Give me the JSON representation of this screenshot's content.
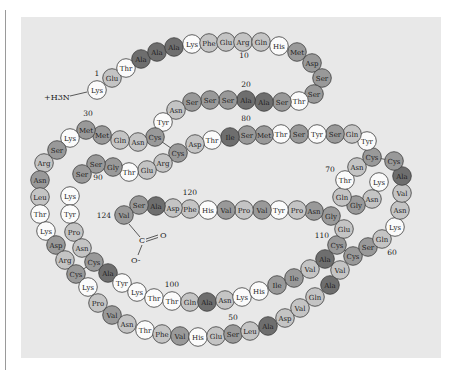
{
  "figure": {
    "title": "",
    "n_terminus": "+H3N",
    "c_terminus": {
      "carbon": "C",
      "double_o": "O",
      "single_o": "O-"
    },
    "position_labels": [
      "1",
      "10",
      "20",
      "30",
      "50",
      "60",
      "70",
      "80",
      "90",
      "100",
      "110",
      "120",
      "124"
    ]
  },
  "colors": {
    "background": "#e8e8e8",
    "shade_white": "#fbfbfb",
    "shade_light": "#c4c4c4",
    "shade_medium": "#999999",
    "shade_dark": "#6e6e6e",
    "outline": "#3a3a3a"
  },
  "residues": [
    {
      "n": 1,
      "aa": "Lys",
      "x": 97,
      "y": 90,
      "s": "w"
    },
    {
      "n": 2,
      "aa": "Glu",
      "x": 112,
      "y": 78,
      "s": "l"
    },
    {
      "n": 3,
      "aa": "Thr",
      "x": 126,
      "y": 68,
      "s": "w"
    },
    {
      "n": 4,
      "aa": "Ala",
      "x": 141,
      "y": 59,
      "s": "d"
    },
    {
      "n": 5,
      "aa": "Ala",
      "x": 157,
      "y": 52,
      "s": "d"
    },
    {
      "n": 6,
      "aa": "Ala",
      "x": 174,
      "y": 47,
      "s": "d"
    },
    {
      "n": 7,
      "aa": "Lys",
      "x": 192,
      "y": 44,
      "s": "w"
    },
    {
      "n": 8,
      "aa": "Phe",
      "x": 209,
      "y": 43,
      "s": "l"
    },
    {
      "n": 9,
      "aa": "Glu",
      "x": 226,
      "y": 42,
      "s": "l"
    },
    {
      "n": 10,
      "aa": "Arg",
      "x": 243,
      "y": 42,
      "s": "l"
    },
    {
      "n": 11,
      "aa": "Gln",
      "x": 261,
      "y": 42,
      "s": "l"
    },
    {
      "n": 12,
      "aa": "His",
      "x": 279,
      "y": 46,
      "s": "w"
    },
    {
      "n": 13,
      "aa": "Met",
      "x": 297,
      "y": 52,
      "s": "m"
    },
    {
      "n": 14,
      "aa": "Asp",
      "x": 312,
      "y": 63,
      "s": "m"
    },
    {
      "n": 15,
      "aa": "Ser",
      "x": 322,
      "y": 78,
      "s": "m"
    },
    {
      "n": 16,
      "aa": "Ser",
      "x": 314,
      "y": 94,
      "s": "m"
    },
    {
      "n": 17,
      "aa": "Thr",
      "x": 299,
      "y": 101,
      "s": "w"
    },
    {
      "n": 18,
      "aa": "Ser",
      "x": 282,
      "y": 102,
      "s": "m"
    },
    {
      "n": 19,
      "aa": "Ala",
      "x": 264,
      "y": 102,
      "s": "d"
    },
    {
      "n": 20,
      "aa": "Ala",
      "x": 246,
      "y": 100,
      "s": "d"
    },
    {
      "n": 21,
      "aa": "Ser",
      "x": 228,
      "y": 100,
      "s": "m"
    },
    {
      "n": 22,
      "aa": "Ser",
      "x": 210,
      "y": 100,
      "s": "m"
    },
    {
      "n": 23,
      "aa": "Ser",
      "x": 192,
      "y": 102,
      "s": "m"
    },
    {
      "n": 24,
      "aa": "Asn",
      "x": 176,
      "y": 110,
      "s": "l"
    },
    {
      "n": 25,
      "aa": "Tyr",
      "x": 163,
      "y": 122,
      "s": "w"
    },
    {
      "n": 26,
      "aa": "Cys",
      "x": 155,
      "y": 137,
      "s": "m"
    },
    {
      "n": 27,
      "aa": "Asn",
      "x": 138,
      "y": 142,
      "s": "l"
    },
    {
      "n": 28,
      "aa": "Gln",
      "x": 120,
      "y": 140,
      "s": "l"
    },
    {
      "n": 29,
      "aa": "Met",
      "x": 102,
      "y": 135,
      "s": "m"
    },
    {
      "n": 30,
      "aa": "Met",
      "x": 86,
      "y": 130,
      "s": "m"
    },
    {
      "n": 31,
      "aa": "Lys",
      "x": 70,
      "y": 138,
      "s": "w"
    },
    {
      "n": 32,
      "aa": "Ser",
      "x": 57,
      "y": 150,
      "s": "m"
    },
    {
      "n": 33,
      "aa": "Arg",
      "x": 44,
      "y": 163,
      "s": "l"
    },
    {
      "n": 34,
      "aa": "Asn",
      "x": 40,
      "y": 180,
      "s": "m"
    },
    {
      "n": 35,
      "aa": "Leu",
      "x": 40,
      "y": 197,
      "s": "l"
    },
    {
      "n": 36,
      "aa": "Thr",
      "x": 40,
      "y": 214,
      "s": "w"
    },
    {
      "n": 37,
      "aa": "Lys",
      "x": 46,
      "y": 231,
      "s": "w"
    },
    {
      "n": 38,
      "aa": "Asp",
      "x": 56,
      "y": 245,
      "s": "m"
    },
    {
      "n": 39,
      "aa": "Arg",
      "x": 65,
      "y": 260,
      "s": "l"
    },
    {
      "n": 40,
      "aa": "Cys",
      "x": 76,
      "y": 274,
      "s": "m"
    },
    {
      "n": 41,
      "aa": "Lys",
      "x": 88,
      "y": 287,
      "s": "w"
    },
    {
      "n": 42,
      "aa": "Pro",
      "x": 98,
      "y": 303,
      "s": "l"
    },
    {
      "n": 43,
      "aa": "Val",
      "x": 112,
      "y": 315,
      "s": "m"
    },
    {
      "n": 44,
      "aa": "Asn",
      "x": 127,
      "y": 324,
      "s": "l"
    },
    {
      "n": 45,
      "aa": "Thr",
      "x": 145,
      "y": 330,
      "s": "w"
    },
    {
      "n": 46,
      "aa": "Phe",
      "x": 162,
      "y": 334,
      "s": "l"
    },
    {
      "n": 47,
      "aa": "Val",
      "x": 180,
      "y": 336,
      "s": "m"
    },
    {
      "n": 48,
      "aa": "His",
      "x": 198,
      "y": 337,
      "s": "w"
    },
    {
      "n": 49,
      "aa": "Glu",
      "x": 216,
      "y": 336,
      "s": "l"
    },
    {
      "n": 50,
      "aa": "Ser",
      "x": 233,
      "y": 334,
      "s": "m"
    },
    {
      "n": 51,
      "aa": "Leu",
      "x": 250,
      "y": 331,
      "s": "l"
    },
    {
      "n": 52,
      "aa": "Ala",
      "x": 268,
      "y": 326,
      "s": "d"
    },
    {
      "n": 53,
      "aa": "Asp",
      "x": 285,
      "y": 318,
      "s": "l"
    },
    {
      "n": 54,
      "aa": "Val",
      "x": 300,
      "y": 308,
      "s": "l"
    },
    {
      "n": 55,
      "aa": "Gln",
      "x": 315,
      "y": 297,
      "s": "l"
    },
    {
      "n": 56,
      "aa": "Ala",
      "x": 330,
      "y": 285,
      "s": "d"
    },
    {
      "n": 57,
      "aa": "Val",
      "x": 340,
      "y": 270,
      "s": "l"
    },
    {
      "n": 58,
      "aa": "Cys",
      "x": 353,
      "y": 256,
      "s": "m"
    },
    {
      "n": 59,
      "aa": "Ser",
      "x": 368,
      "y": 247,
      "s": "m"
    },
    {
      "n": 60,
      "aa": "Gln",
      "x": 382,
      "y": 239,
      "s": "l"
    },
    {
      "n": 61,
      "aa": "Lys",
      "x": 395,
      "y": 227,
      "s": "w"
    },
    {
      "n": 62,
      "aa": "Asn",
      "x": 400,
      "y": 210,
      "s": "l"
    },
    {
      "n": 63,
      "aa": "Val",
      "x": 402,
      "y": 193,
      "s": "l"
    },
    {
      "n": 64,
      "aa": "Ala",
      "x": 402,
      "y": 176,
      "s": "d"
    },
    {
      "n": 65,
      "aa": "Cys",
      "x": 394,
      "y": 161,
      "s": "m"
    },
    {
      "n": 66,
      "aa": "Lys",
      "x": 379,
      "y": 182,
      "s": "w"
    },
    {
      "n": 67,
      "aa": "Asn",
      "x": 372,
      "y": 199,
      "s": "l"
    },
    {
      "n": 68,
      "aa": "Gly",
      "x": 356,
      "y": 205,
      "s": "m"
    },
    {
      "n": 69,
      "aa": "Gln",
      "x": 342,
      "y": 197,
      "s": "l"
    },
    {
      "n": 70,
      "aa": "Thr",
      "x": 345,
      "y": 180,
      "s": "w"
    },
    {
      "n": 71,
      "aa": "Asn",
      "x": 357,
      "y": 167,
      "s": "l"
    },
    {
      "n": 72,
      "aa": "Cys",
      "x": 372,
      "y": 157,
      "s": "m"
    },
    {
      "n": 73,
      "aa": "Tyr",
      "x": 367,
      "y": 141,
      "s": "w"
    },
    {
      "n": 74,
      "aa": "Gln",
      "x": 352,
      "y": 134,
      "s": "l"
    },
    {
      "n": 75,
      "aa": "Ser",
      "x": 335,
      "y": 134,
      "s": "m"
    },
    {
      "n": 76,
      "aa": "Tyr",
      "x": 317,
      "y": 134,
      "s": "w"
    },
    {
      "n": 77,
      "aa": "Ser",
      "x": 299,
      "y": 134,
      "s": "m"
    },
    {
      "n": 78,
      "aa": "Thr",
      "x": 281,
      "y": 134,
      "s": "w"
    },
    {
      "n": 79,
      "aa": "Met",
      "x": 264,
      "y": 135,
      "s": "m"
    },
    {
      "n": 80,
      "aa": "Ser",
      "x": 247,
      "y": 135,
      "s": "m"
    },
    {
      "n": 81,
      "aa": "Ile",
      "x": 230,
      "y": 137,
      "s": "d"
    },
    {
      "n": 82,
      "aa": "Thr",
      "x": 212,
      "y": 140,
      "s": "w"
    },
    {
      "n": 83,
      "aa": "Asp",
      "x": 195,
      "y": 144,
      "s": "l"
    },
    {
      "n": 84,
      "aa": "Cys",
      "x": 178,
      "y": 153,
      "s": "m"
    },
    {
      "n": 85,
      "aa": "Arg",
      "x": 163,
      "y": 163,
      "s": "l"
    },
    {
      "n": 86,
      "aa": "Glu",
      "x": 147,
      "y": 170,
      "s": "l"
    },
    {
      "n": 87,
      "aa": "Thr",
      "x": 129,
      "y": 172,
      "s": "w"
    },
    {
      "n": 88,
      "aa": "Gly",
      "x": 113,
      "y": 167,
      "s": "m"
    },
    {
      "n": 89,
      "aa": "Ser",
      "x": 96,
      "y": 164,
      "s": "m"
    },
    {
      "n": 90,
      "aa": "Ser",
      "x": 82,
      "y": 174,
      "s": "m"
    },
    {
      "n": 91,
      "aa": "Lys",
      "x": 70,
      "y": 196,
      "s": "w"
    },
    {
      "n": 92,
      "aa": "Tyr",
      "x": 70,
      "y": 214,
      "s": "w"
    },
    {
      "n": 93,
      "aa": "Pro",
      "x": 74,
      "y": 232,
      "s": "l"
    },
    {
      "n": 94,
      "aa": "Asn",
      "x": 82,
      "y": 248,
      "s": "l"
    },
    {
      "n": 95,
      "aa": "Cys",
      "x": 94,
      "y": 262,
      "s": "m"
    },
    {
      "n": 96,
      "aa": "Ala",
      "x": 108,
      "y": 273,
      "s": "d"
    },
    {
      "n": 97,
      "aa": "Tyr",
      "x": 122,
      "y": 283,
      "s": "w"
    },
    {
      "n": 98,
      "aa": "Lys",
      "x": 137,
      "y": 292,
      "s": "w"
    },
    {
      "n": 99,
      "aa": "Thr",
      "x": 154,
      "y": 298,
      "s": "w"
    },
    {
      "n": 100,
      "aa": "Thr",
      "x": 172,
      "y": 301,
      "s": "w"
    },
    {
      "n": 101,
      "aa": "Gln",
      "x": 190,
      "y": 302,
      "s": "l"
    },
    {
      "n": 102,
      "aa": "Ala",
      "x": 207,
      "y": 302,
      "s": "d"
    },
    {
      "n": 103,
      "aa": "Asn",
      "x": 225,
      "y": 300,
      "s": "l"
    },
    {
      "n": 104,
      "aa": "Lys",
      "x": 242,
      "y": 297,
      "s": "w"
    },
    {
      "n": 105,
      "aa": "His",
      "x": 259,
      "y": 291,
      "s": "w"
    },
    {
      "n": 106,
      "aa": "Ile",
      "x": 277,
      "y": 285,
      "s": "m"
    },
    {
      "n": 107,
      "aa": "Ile",
      "x": 294,
      "y": 278,
      "s": "m"
    },
    {
      "n": 108,
      "aa": "Val",
      "x": 310,
      "y": 269,
      "s": "l"
    },
    {
      "n": 109,
      "aa": "Ala",
      "x": 325,
      "y": 259,
      "s": "d"
    },
    {
      "n": 110,
      "aa": "Cys",
      "x": 337,
      "y": 245,
      "s": "m"
    },
    {
      "n": 111,
      "aa": "Glu",
      "x": 344,
      "y": 229,
      "s": "l"
    },
    {
      "n": 112,
      "aa": "Gly",
      "x": 331,
      "y": 216,
      "s": "m"
    },
    {
      "n": 113,
      "aa": "Asn",
      "x": 314,
      "y": 211,
      "s": "m"
    },
    {
      "n": 114,
      "aa": "Pro",
      "x": 297,
      "y": 210,
      "s": "l"
    },
    {
      "n": 115,
      "aa": "Tyr",
      "x": 279,
      "y": 210,
      "s": "w"
    },
    {
      "n": 116,
      "aa": "Val",
      "x": 262,
      "y": 210,
      "s": "m"
    },
    {
      "n": 117,
      "aa": "Pro",
      "x": 244,
      "y": 210,
      "s": "l"
    },
    {
      "n": 118,
      "aa": "Val",
      "x": 226,
      "y": 210,
      "s": "m"
    },
    {
      "n": 119,
      "aa": "His",
      "x": 208,
      "y": 210,
      "s": "w"
    },
    {
      "n": 120,
      "aa": "Phe",
      "x": 190,
      "y": 209,
      "s": "l"
    },
    {
      "n": 121,
      "aa": "Asp",
      "x": 173,
      "y": 208,
      "s": "l"
    },
    {
      "n": 122,
      "aa": "Ala",
      "x": 156,
      "y": 206,
      "s": "d"
    },
    {
      "n": 123,
      "aa": "Ser",
      "x": 139,
      "y": 205,
      "s": "m"
    },
    {
      "n": 124,
      "aa": "Val",
      "x": 124,
      "y": 215,
      "s": "m"
    }
  ],
  "disulfide_bonds": [
    [
      26,
      84
    ],
    [
      40,
      95
    ],
    [
      58,
      110
    ],
    [
      65,
      72
    ]
  ]
}
